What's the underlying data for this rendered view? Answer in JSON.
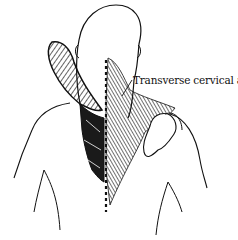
{
  "figure": {
    "labels": [
      {
        "text": "Transverse cervical a.",
        "points_to": "neck-right-muscle-region"
      }
    ],
    "colors": {
      "line": "#111111",
      "background": "#ffffff"
    }
  }
}
